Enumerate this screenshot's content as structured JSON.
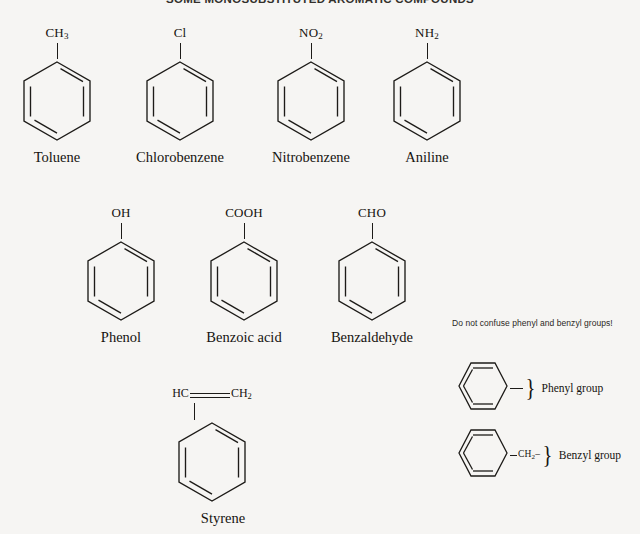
{
  "title": "SOME MONOSUBSTITUTED AROMATIC COMPOUNDS",
  "background_color": "#f6f5f3",
  "line_color": "#1d1b18",
  "rows": {
    "row1": [
      {
        "name": "Toluene",
        "substituent": "CH",
        "substituent_sub": "3",
        "formula": "CH3"
      },
      {
        "name": "Chlorobenzene",
        "substituent": "Cl",
        "substituent_sub": "",
        "formula": "Cl"
      },
      {
        "name": "Nitrobenzene",
        "substituent": "NO",
        "substituent_sub": "2",
        "formula": "NO2"
      },
      {
        "name": "Aniline",
        "substituent": "NH",
        "substituent_sub": "2",
        "formula": "NH2"
      }
    ],
    "row2": [
      {
        "name": "Phenol",
        "substituent": "OH",
        "substituent_sub": "",
        "formula": "OH"
      },
      {
        "name": "Benzoic acid",
        "substituent": "COOH",
        "substituent_sub": "",
        "formula": "COOH"
      },
      {
        "name": "Benzaldehyde",
        "substituent": "CHO",
        "substituent_sub": "",
        "formula": "CHO"
      }
    ],
    "row3": [
      {
        "name": "Styrene",
        "substituent_left": "HC",
        "substituent_right": "CH",
        "substituent_right_sub": "2",
        "formula": "HC=CH2",
        "bond": "double"
      }
    ]
  },
  "groups_panel": {
    "note": "Do not confuse phenyl and benzyl groups!",
    "items": [
      {
        "label": "Phenyl group",
        "attachment": "",
        "attachment_sub": "",
        "brace": "}"
      },
      {
        "label": "Benzyl group",
        "attachment": "CH",
        "attachment_sub": "2",
        "suffix": "–",
        "brace": "}"
      }
    ]
  }
}
